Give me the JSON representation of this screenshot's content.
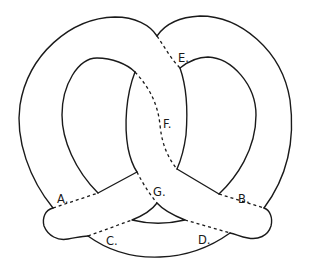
{
  "diagram": {
    "stroke_color": "#1a1a1a",
    "background": "#ffffff",
    "cut_lines": [
      {
        "id": "A",
        "label": "A.",
        "x": 57,
        "y": 203
      },
      {
        "id": "B",
        "label": "B.",
        "x": 238,
        "y": 203
      },
      {
        "id": "C",
        "label": "C.",
        "x": 106,
        "y": 245
      },
      {
        "id": "D",
        "label": "D.",
        "x": 198,
        "y": 244
      },
      {
        "id": "E",
        "label": "E.",
        "x": 178,
        "y": 62
      },
      {
        "id": "F",
        "label": "F.",
        "x": 163,
        "y": 128
      },
      {
        "id": "G",
        "label": "G.",
        "x": 153,
        "y": 196
      }
    ]
  }
}
